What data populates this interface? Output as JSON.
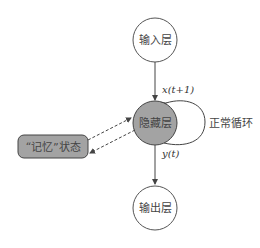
{
  "diagram": {
    "type": "rnn-structure",
    "nodes": {
      "input": {
        "label": "输入层",
        "fill": "#ffffff"
      },
      "hidden": {
        "label": "隐藏层",
        "fill": "#a3a3a3"
      },
      "output": {
        "label": "输出层",
        "fill": "#ffffff"
      },
      "memory": {
        "label": "“记忆”状态",
        "fill": "#a3a3a3"
      }
    },
    "edges": {
      "input_to_hidden": {
        "label": "x(t+1)"
      },
      "hidden_to_output": {
        "label": "y(t)"
      },
      "self_loop": {
        "label": "正常循环"
      },
      "memory_link": {
        "style": "dashed",
        "direction": "bidirectional"
      }
    },
    "colors": {
      "stroke": "#444444",
      "node_gray": "#a3a3a3",
      "background": "#ffffff"
    }
  }
}
